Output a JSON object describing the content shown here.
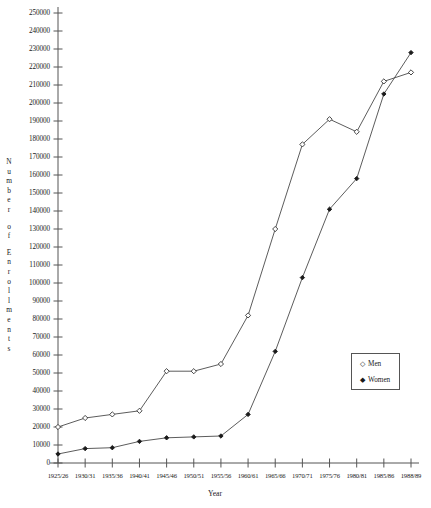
{
  "chart_data": {
    "type": "line",
    "title": "",
    "xlabel": "Year",
    "ylabel": "Number of Enrollments",
    "ylabel_letters": [
      "N",
      "u",
      "m",
      "b",
      "e",
      "r",
      "",
      "o",
      "f",
      "",
      "E",
      "n",
      "r",
      "o",
      "l",
      "l",
      "m",
      "e",
      "n",
      "t",
      "s"
    ],
    "categories": [
      "1925/26",
      "1930/31",
      "1935/36",
      "1940/41",
      "1945/46",
      "1950/51",
      "1955/56",
      "1960/61",
      "1965/66",
      "1970/71",
      "1975/76",
      "1980/81",
      "1985/86",
      "1988/89"
    ],
    "ylim": [
      0,
      250000
    ],
    "ytick_step": 10000,
    "ytick_labels": [
      "0",
      "10000",
      "20000",
      "30000",
      "40000",
      "50000",
      "60000",
      "70000",
      "80000",
      "90000",
      "100000",
      "110000",
      "120000",
      "130000",
      "140000",
      "150000",
      "160000",
      "170000",
      "180000",
      "190000",
      "200000",
      "210000",
      "220000",
      "230000",
      "240000",
      "250000"
    ],
    "grid": false,
    "legend_position": "center-right",
    "series": [
      {
        "name": "Men",
        "marker": "open-diamond",
        "values": [
          20000,
          25000,
          27000,
          29000,
          51000,
          51000,
          55000,
          82000,
          130000,
          177000,
          191000,
          184000,
          212000,
          217000
        ]
      },
      {
        "name": "Women",
        "marker": "filled-diamond",
        "values": [
          5000,
          8000,
          8500,
          12000,
          14000,
          14500,
          15000,
          27000,
          62000,
          103000,
          141000,
          158000,
          205000,
          228000
        ]
      }
    ]
  },
  "legend": {
    "entries": [
      {
        "label": "Men",
        "symbol": "◇"
      },
      {
        "label": "Women",
        "symbol": "◆"
      }
    ]
  },
  "axes": {
    "x_title": "Year",
    "y_title": "Number of Enrollments"
  }
}
